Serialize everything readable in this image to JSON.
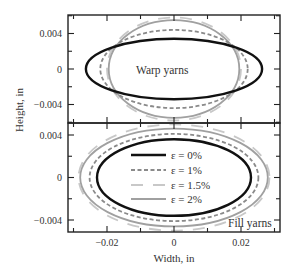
{
  "chart_data": [
    {
      "type": "line",
      "panel": "upper",
      "title": "",
      "annotation": "Warp yarns",
      "xlabel": "Width, in",
      "ylabel": "Height, in",
      "xlim": [
        -0.032,
        0.032
      ],
      "ylim": [
        -0.0061,
        0.0061
      ],
      "x_ticks": [
        -0.02,
        0,
        0.02
      ],
      "y_ticks": [
        -0.004,
        0,
        0.004
      ],
      "y_tick_labels": [
        "0.004",
        "0",
        "−0.004"
      ],
      "grid": false,
      "series": [
        {
          "name": "ε = 0%",
          "shape": "ellipse",
          "half_width": 0.0263,
          "half_height": 0.0034,
          "color": "#111111",
          "style": "solid"
        },
        {
          "name": "ε = 1%",
          "shape": "ellipse",
          "half_width": 0.022,
          "half_height": 0.0044,
          "color": "#8a8a8a",
          "style": "dashed"
        },
        {
          "name": "ε = 1.5%",
          "shape": "ellipse",
          "half_width": 0.02,
          "half_height": 0.0058,
          "color": "#c8c8c8",
          "style": "longdash"
        },
        {
          "name": "ε = 2%",
          "shape": "ellipse",
          "half_width": 0.0195,
          "half_height": 0.0055,
          "color": "#a0a0a0",
          "style": "solid"
        }
      ]
    },
    {
      "type": "line",
      "panel": "lower",
      "title": "",
      "annotation": "Fill yarns",
      "xlabel": "Width, in",
      "ylabel": "Height, in",
      "xlim": [
        -0.032,
        0.032
      ],
      "ylim": [
        -0.0052,
        0.0053
      ],
      "x_ticks": [
        -0.02,
        0,
        0.02
      ],
      "x_tick_labels": [
        "−0.02",
        "0",
        "0.02"
      ],
      "y_ticks": [
        -0.004,
        0,
        0.004
      ],
      "y_tick_labels": [
        "0.004",
        "0",
        "−0.004"
      ],
      "grid": false,
      "legend": {
        "position": "center",
        "entries": [
          "ε = 0%",
          "ε = 1%",
          "ε = 1.5%",
          "ε = 2%"
        ]
      },
      "series": [
        {
          "name": "ε = 0%",
          "shape": "ellipse",
          "half_width": 0.023,
          "half_height": 0.0036,
          "color": "#111111",
          "style": "solid"
        },
        {
          "name": "ε = 1%",
          "shape": "ellipse",
          "half_width": 0.0252,
          "half_height": 0.0041,
          "color": "#8a8a8a",
          "style": "dashed"
        },
        {
          "name": "ε = 1.5%",
          "shape": "ellipse",
          "half_width": 0.0285,
          "half_height": 0.005,
          "color": "#c8c8c8",
          "style": "longdash"
        },
        {
          "name": "ε = 2%",
          "shape": "ellipse",
          "half_width": 0.028,
          "half_height": 0.0046,
          "color": "#a0a0a0",
          "style": "solid"
        }
      ]
    }
  ],
  "labels": {
    "xlabel": "Width, in",
    "ylabel": "Height, in",
    "upper_annotation": "Warp yarns",
    "lower_annotation": "Fill yarns",
    "x_tick_labels": [
      "−0.02",
      "0",
      "0.02"
    ],
    "upper_y_tick_labels": [
      "0.004",
      "0",
      "−0.004"
    ],
    "lower_y_tick_labels": [
      "0.004",
      "0",
      "−0.004"
    ],
    "legend": [
      "ε = 0%",
      "ε = 1%",
      "ε = 1.5%",
      "ε = 2%"
    ]
  }
}
